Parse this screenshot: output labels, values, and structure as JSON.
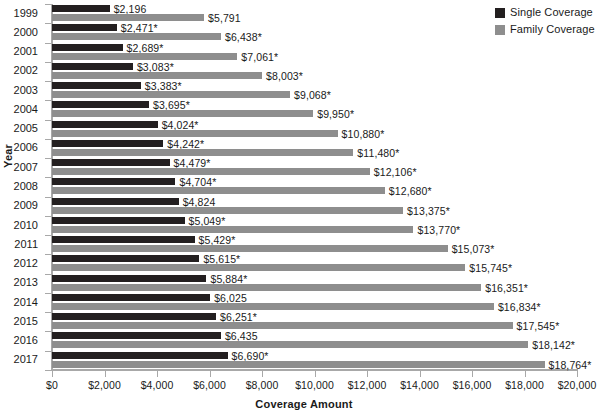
{
  "chart_data": {
    "type": "bar",
    "orientation": "horizontal",
    "title": "",
    "xlabel": "Coverage Amount",
    "ylabel": "Year",
    "xlim": [
      0,
      20000
    ],
    "xticks": [
      0,
      2000,
      4000,
      6000,
      8000,
      10000,
      12000,
      14000,
      16000,
      18000,
      20000
    ],
    "xtick_labels": [
      "$0",
      "$2,000",
      "$4,000",
      "$6,000",
      "$8,000",
      "$10,000",
      "$12,000",
      "$14,000",
      "$16,000",
      "$18,000",
      "$20,000"
    ],
    "grid": false,
    "legend_position": "top-right",
    "categories": [
      "1999",
      "2000",
      "2001",
      "2002",
      "2003",
      "2004",
      "2005",
      "2006",
      "2007",
      "2008",
      "2009",
      "2010",
      "2011",
      "2012",
      "2013",
      "2014",
      "2015",
      "2016",
      "2017"
    ],
    "series": [
      {
        "name": "Single Coverage",
        "color": "#231f20",
        "values": [
          2196,
          2471,
          2689,
          3083,
          3383,
          3695,
          4024,
          4242,
          4479,
          4704,
          4824,
          5049,
          5429,
          5615,
          5884,
          6025,
          6251,
          6435,
          6690
        ],
        "labels": [
          "$2,196",
          "$2,471*",
          "$2,689*",
          "$3,083*",
          "$3,383*",
          "$3,695*",
          "$4,024*",
          "$4,242*",
          "$4,479*",
          "$4,704*",
          "$4,824",
          "$5,049*",
          "$5,429*",
          "$5,615*",
          "$5,884*",
          "$6,025",
          "$6,251*",
          "$6,435",
          "$6,690*"
        ]
      },
      {
        "name": "Family Coverage",
        "color": "#8e8e8e",
        "values": [
          5791,
          6438,
          7061,
          8003,
          9068,
          9950,
          10880,
          11480,
          12106,
          12680,
          13375,
          13770,
          15073,
          15745,
          16351,
          16834,
          17545,
          18142,
          18764
        ],
        "labels": [
          "$5,791",
          "$6,438*",
          "$7,061*",
          "$8,003*",
          "$9,068*",
          "$9,950*",
          "$10,880*",
          "$11,480*",
          "$12,106*",
          "$12,680*",
          "$13,375*",
          "$13,770*",
          "$15,073*",
          "$15,745*",
          "$16,351*",
          "$16,834*",
          "$17,545*",
          "$18,142*",
          "$18,764*"
        ]
      }
    ]
  },
  "legend": {
    "items": [
      {
        "label": "Single Coverage",
        "color": "#231f20"
      },
      {
        "label": "Family Coverage",
        "color": "#8e8e8e"
      }
    ]
  },
  "axes": {
    "x_title": "Coverage Amount",
    "y_title": "Year"
  }
}
